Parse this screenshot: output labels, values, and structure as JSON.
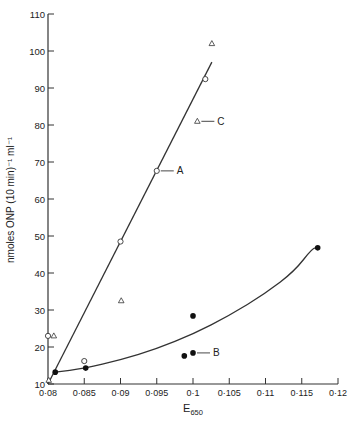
{
  "chart_data": {
    "type": "scatter",
    "title": "",
    "xlabel": "E",
    "xlabel_subscript": "650",
    "ylabel": "nmoles ONP (10 min)⁻¹ ml⁻¹",
    "xlim": [
      0.08,
      0.12
    ],
    "ylim": [
      10,
      110
    ],
    "x_ticks": [
      "0·08",
      "0·085",
      "0·09",
      "0·095",
      "0·1",
      "0·105",
      "0·11",
      "0·115",
      "0·12"
    ],
    "x_tick_values": [
      0.08,
      0.085,
      0.09,
      0.095,
      0.1,
      0.105,
      0.11,
      0.115,
      0.12
    ],
    "y_ticks": [
      "10",
      "20",
      "30",
      "40",
      "50",
      "60",
      "70",
      "80",
      "90",
      "100",
      "110"
    ],
    "y_tick_values": [
      10,
      20,
      30,
      40,
      50,
      60,
      70,
      80,
      90,
      100,
      110
    ],
    "grid": false,
    "series": [
      {
        "name": "A",
        "marker": "open-circle",
        "points": [
          [
            0.08,
            23
          ],
          [
            0.085,
            16.2
          ],
          [
            0.09,
            48.5
          ],
          [
            0.095,
            67.6
          ],
          [
            0.1017,
            92.4
          ]
        ],
        "fit": {
          "type": "line",
          "from": [
            0.08,
            10
          ],
          "to": [
            0.1026,
            97
          ]
        }
      },
      {
        "name": "B",
        "marker": "filled-circle",
        "points": [
          [
            0.081,
            13.2
          ],
          [
            0.0852,
            14.3
          ],
          [
            0.0988,
            17.6
          ],
          [
            0.1,
            18.4
          ],
          [
            0.1,
            28.4
          ],
          [
            0.1172,
            46.8
          ]
        ],
        "fit": {
          "type": "curve",
          "points": [
            [
              0.081,
              13.2
            ],
            [
              0.085,
              14.2
            ],
            [
              0.09,
              16.5
            ],
            [
              0.095,
              19.5
            ],
            [
              0.1,
              23.5
            ],
            [
              0.105,
              28.5
            ],
            [
              0.11,
              34.5
            ],
            [
              0.114,
              40.5
            ],
            [
              0.1165,
              46.8
            ],
            [
              0.1172,
              46.8
            ]
          ]
        }
      },
      {
        "name": "C",
        "marker": "open-triangle",
        "points": [
          [
            0.0808,
            23
          ],
          [
            0.0801,
            11
          ],
          [
            0.0901,
            32.5
          ],
          [
            0.1006,
            81
          ],
          [
            0.1026,
            102
          ]
        ]
      }
    ],
    "annotations": [
      {
        "text": "A",
        "at": [
          0.095,
          67.6
        ]
      },
      {
        "text": "B",
        "at": [
          0.1,
          18.4
        ]
      },
      {
        "text": "C",
        "at": [
          0.1006,
          81
        ]
      }
    ]
  }
}
